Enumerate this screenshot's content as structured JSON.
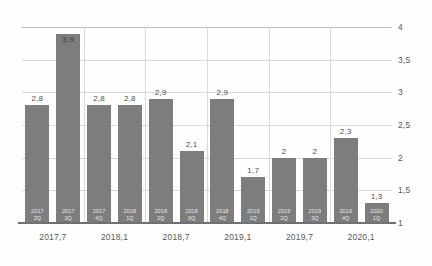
{
  "chart_data": {
    "type": "bar",
    "title": "",
    "subtitle": "",
    "xlabel": "",
    "ylabel": "",
    "ylim": [
      1,
      4
    ],
    "ytick_labels": [
      "1",
      "1,5",
      "2",
      "2,5",
      "3",
      "3,5",
      "4"
    ],
    "ytick_values": [
      1,
      1.5,
      2,
      2.5,
      3,
      3.5,
      4
    ],
    "xtick_labels": [
      "2017,7",
      "2018,1",
      "2018,7",
      "2019,1",
      "2019,7",
      "2020,1"
    ],
    "grid": "both",
    "legend": "none",
    "bar_color": "#7d7d7d",
    "categories": [
      "2017 2Q",
      "2017 3Q",
      "2017 4Q",
      "2018 1Q",
      "2018 2Q",
      "2018 3Q",
      "2018 4Q",
      "2019 1Q",
      "2019 2Q",
      "2019 3Q",
      "2019 4Q",
      "2020 1Q"
    ],
    "values": [
      2.8,
      3.9,
      2.8,
      2.8,
      2.9,
      2.1,
      2.9,
      1.7,
      2.0,
      2.0,
      2.3,
      1.3
    ],
    "value_labels": [
      "2,8",
      "3,9",
      "2,8",
      "2,8",
      "2,9",
      "2,1",
      "2,9",
      "1,7",
      "2",
      "2",
      "2,3",
      "1,3"
    ],
    "bars": [
      {
        "period_year": "2017",
        "period_quarter": "2Q",
        "value": 2.8,
        "label": "2,8",
        "label_position": "outside"
      },
      {
        "period_year": "2017",
        "period_quarter": "3Q",
        "value": 3.9,
        "label": "3,9",
        "label_position": "inside"
      },
      {
        "period_year": "2017",
        "period_quarter": "4Q",
        "value": 2.8,
        "label": "2,8",
        "label_position": "outside"
      },
      {
        "period_year": "2018",
        "period_quarter": "1Q",
        "value": 2.8,
        "label": "2,8",
        "label_position": "outside"
      },
      {
        "period_year": "2018",
        "period_quarter": "2Q",
        "value": 2.9,
        "label": "2,9",
        "label_position": "outside"
      },
      {
        "period_year": "2018",
        "period_quarter": "3Q",
        "value": 2.1,
        "label": "2,1",
        "label_position": "outside"
      },
      {
        "period_year": "2018",
        "period_quarter": "4Q",
        "value": 2.9,
        "label": "2,9",
        "label_position": "outside"
      },
      {
        "period_year": "2019",
        "period_quarter": "1Q",
        "value": 1.7,
        "label": "1,7",
        "label_position": "outside"
      },
      {
        "period_year": "2019",
        "period_quarter": "2Q",
        "value": 2.0,
        "label": "2",
        "label_position": "outside"
      },
      {
        "period_year": "2019",
        "period_quarter": "3Q",
        "value": 2.0,
        "label": "2",
        "label_position": "outside"
      },
      {
        "period_year": "2019",
        "period_quarter": "4Q",
        "value": 2.3,
        "label": "2,3",
        "label_position": "outside"
      },
      {
        "period_year": "2020",
        "period_quarter": "1Q",
        "value": 1.3,
        "label": "1,3",
        "label_position": "outside"
      }
    ]
  }
}
